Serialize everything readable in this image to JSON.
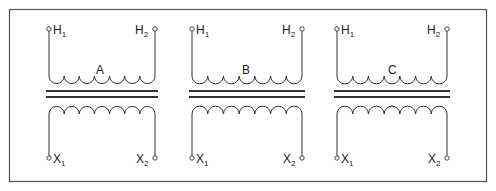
{
  "diagram": {
    "frame": {
      "x": 9,
      "y": 9,
      "width": 477,
      "height": 172,
      "stroke": "#555555"
    },
    "line_color": "#333333",
    "transformers": [
      {
        "name": "A",
        "left_x": 49,
        "right_x": 155,
        "primary": {
          "terminal_1": "H",
          "terminal_1_sub": "1",
          "terminal_2": "H",
          "terminal_2_sub": "2"
        },
        "secondary": {
          "terminal_1": "X",
          "terminal_1_sub": "1",
          "terminal_2": "X",
          "terminal_2_sub": "2"
        }
      },
      {
        "name": "B",
        "left_x": 192,
        "right_x": 302,
        "primary": {
          "terminal_1": "H",
          "terminal_1_sub": "1",
          "terminal_2": "H",
          "terminal_2_sub": "2"
        },
        "secondary": {
          "terminal_1": "X",
          "terminal_1_sub": "1",
          "terminal_2": "X",
          "terminal_2_sub": "2"
        }
      },
      {
        "name": "C",
        "left_x": 337,
        "right_x": 447,
        "primary": {
          "terminal_1": "H",
          "terminal_1_sub": "1",
          "terminal_2": "H",
          "terminal_2_sub": "2"
        },
        "secondary": {
          "terminal_1": "X",
          "terminal_1_sub": "1",
          "terminal_2": "X",
          "terminal_2_sub": "2"
        }
      }
    ],
    "coil_turns": 7,
    "terminal_y_top": 29,
    "terminal_y_bottom": 158,
    "core_y": [
      91,
      97
    ]
  }
}
